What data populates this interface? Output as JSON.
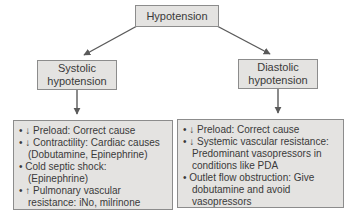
{
  "diagram": {
    "root_label": "Hypotension",
    "left_branch": {
      "label": "Systolic\nhypotension"
    },
    "right_branch": {
      "label": "Diastolic\nhypotension"
    },
    "left_box": {
      "items": [
        "• ↓ Preload: Correct cause",
        "• ↓ Contractility: Cardiac causes (Dobutamine, Epinephrine)",
        "• Cold septic shock: (Epinephrine)",
        "• ↑ Pulmonary vascular resistance: iNo, milrinone"
      ]
    },
    "right_box": {
      "items": [
        "• ↓ Preload: Correct cause",
        "• ↓ Systemic vascular resistance: Predominant vasopressors in conditions like PDA",
        "• Outlet flow obstruction: Give dobutamine and avoid vasopressors"
      ]
    },
    "colors": {
      "box_fill": "#e4e3e1",
      "box_border": "#8c8c8c",
      "arrow": "#5a5a5a",
      "text": "#3a3a3a"
    }
  }
}
